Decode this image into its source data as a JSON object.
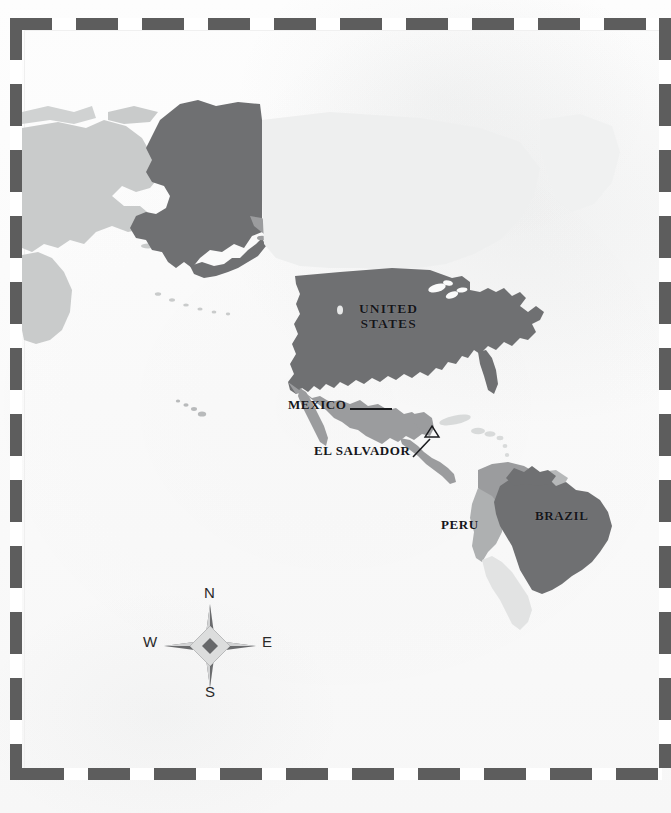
{
  "document": {
    "type": "map",
    "title": "Map of the Americas with highlighted countries",
    "projection_region": "North and South America, Pacific Ocean"
  },
  "colors": {
    "highlight_dark": "#6f7072",
    "region_medium": "#9b9c9e",
    "land_light": "#c9cbcb",
    "land_faint": "#d8dada",
    "label_text": "#15161a",
    "frame_dash": "#5d5d5d",
    "paper": "#fdfdfd",
    "compass_dark": "#5f6062",
    "compass_light": "#d2d3d4"
  },
  "labels": [
    {
      "id": "united-states",
      "text_line1": "UNITED",
      "text_line2": "STATES",
      "country": "United States",
      "shade": "highlight_dark",
      "leader": "none"
    },
    {
      "id": "mexico",
      "text": "MEXICO",
      "country": "Mexico",
      "shade": "region_medium",
      "leader": "horizontal"
    },
    {
      "id": "el-salvador",
      "text": "EL SALVADOR",
      "country": "El Salvador",
      "shade": "marker",
      "leader": "diagonal",
      "marker": "triangle-outline"
    },
    {
      "id": "peru",
      "text": "PERU",
      "country": "Peru",
      "shade": "region_medium",
      "leader": "none"
    },
    {
      "id": "brazil",
      "text": "BRAZIL",
      "country": "Brazil",
      "shade": "highlight_dark",
      "leader": "none"
    }
  ],
  "compass": {
    "name": "compass-rose",
    "north": "N",
    "south": "S",
    "west": "W",
    "east": "E",
    "style": "four-point-star"
  },
  "frame": {
    "style": "dashed-border",
    "dash_length_px": 42,
    "gap_length_px": 24
  },
  "landmasses": [
    {
      "name": "Siberia / Russia (far east)",
      "shade": "land_light"
    },
    {
      "name": "Alaska",
      "shade": "highlight_dark"
    },
    {
      "name": "Canada",
      "shade": "land_faint"
    },
    {
      "name": "United States (contiguous)",
      "shade": "highlight_dark"
    },
    {
      "name": "Mexico",
      "shade": "region_medium"
    },
    {
      "name": "Central America",
      "shade": "region_medium"
    },
    {
      "name": "Caribbean islands",
      "shade": "land_faint"
    },
    {
      "name": "Hawaii",
      "shade": "land_light"
    },
    {
      "name": "Colombia / Venezuela",
      "shade": "region_medium"
    },
    {
      "name": "Peru",
      "shade": "region_medium"
    },
    {
      "name": "Brazil",
      "shade": "highlight_dark"
    },
    {
      "name": "Rest of South America",
      "shade": "land_faint"
    }
  ]
}
